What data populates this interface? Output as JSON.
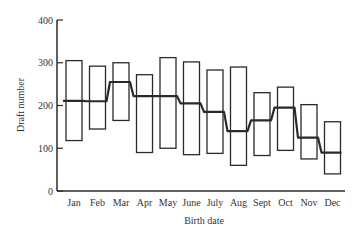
{
  "chart_data": {
    "type": "box",
    "title": "",
    "xlabel": "Birth date",
    "ylabel": "Draft number",
    "ylim": [
      0,
      400
    ],
    "yticks": [
      0,
      100,
      200,
      300,
      400
    ],
    "grid": false,
    "legend": null,
    "categories": [
      "Jan",
      "Feb",
      "Mar",
      "Apr",
      "May",
      "June",
      "July",
      "Aug",
      "Sept",
      "Oct",
      "Nov",
      "Dec"
    ],
    "series": [
      {
        "name": "upper_quartile",
        "values": [
          305,
          292,
          300,
          272,
          312,
          302,
          283,
          290,
          230,
          243,
          202,
          162
        ]
      },
      {
        "name": "median",
        "values": [
          211,
          210,
          255,
          222,
          222,
          205,
          185,
          140,
          165,
          195,
          125,
          90
        ]
      },
      {
        "name": "lower_quartile",
        "values": [
          118,
          145,
          165,
          90,
          100,
          85,
          88,
          60,
          83,
          95,
          75,
          40
        ]
      }
    ]
  },
  "colors": {
    "ink": "#2a2a2a",
    "background": "#ffffff"
  }
}
